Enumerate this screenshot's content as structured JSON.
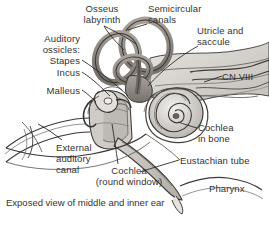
{
  "figure": {
    "title": "Exposed view of middle and inner ear",
    "caption": "Exposed view of middle and inner ear",
    "background_color": "#ffffff",
    "text_color": "#333333",
    "width": 269,
    "height": 228
  },
  "labels": {
    "osseus_labyrinth": "Osseus\nlabyrinth",
    "auditory_ossicles": "Auditory\nossicles:\nStapes",
    "incus": "Incus",
    "malleus": "Malleus",
    "semicircular_canals": "Semicircular\ncanals",
    "utricle_and_saccule": "Utricle and\nsaccule",
    "cn_viii": "CN VIII",
    "cochlea_in_bone": "Cochlea\nin bone",
    "eustachian_tube": "Eustachian tube",
    "pharynx": "Pharynx",
    "external_auditory_canal": "External\nauditory\ncanal",
    "cochlea_round_window": "Cochlea\n(round window)"
  },
  "anatomy": {
    "structures": [
      "Osseus labyrinth",
      "Semicircular canals",
      "Utricle and saccule",
      "Auditory ossicles: Stapes",
      "Incus",
      "Malleus",
      "CN VIII",
      "Cochlea in bone",
      "Cochlea (round window)",
      "External auditory canal",
      "Eustachian tube",
      "Pharynx"
    ]
  },
  "colors": {
    "ink": "#2b2b2b",
    "bone_fill": "#d8d5d0",
    "labyrinth_fill": "#8e8883",
    "soft_tissue": "#c9c5c0",
    "shadow": "#9b9691",
    "light_fill": "#e8e6e3"
  }
}
